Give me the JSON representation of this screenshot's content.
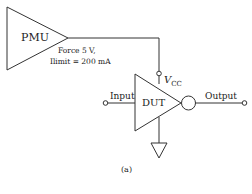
{
  "diagram": {
    "pmu": {
      "label": "PMU"
    },
    "pmu_settings": {
      "force": "Force 5 V,",
      "ilimit": "Ilimit = 200 mA"
    },
    "vcc": {
      "label": "V",
      "subscript": "CC"
    },
    "dut": {
      "label": "DUT"
    },
    "input": {
      "label": "Input"
    },
    "output": {
      "label": "Output"
    },
    "caption": "(a)",
    "colors": {
      "stroke": "#333333",
      "background": "#ffffff"
    }
  }
}
